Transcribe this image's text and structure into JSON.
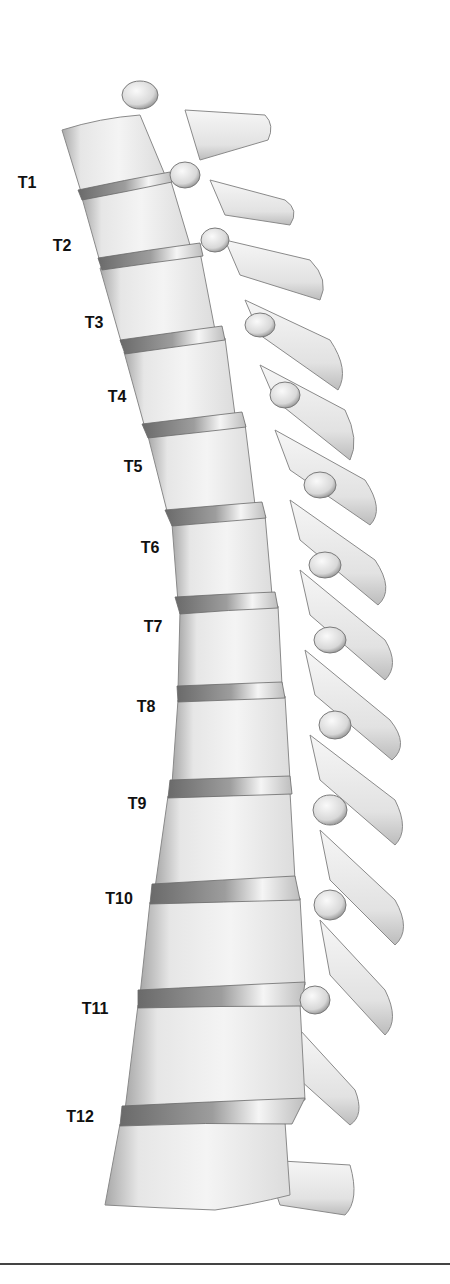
{
  "figure": {
    "labels": [
      {
        "text": "T1",
        "x": 27,
        "y": 183
      },
      {
        "text": "T2",
        "x": 62,
        "y": 246
      },
      {
        "text": "T3",
        "x": 94,
        "y": 323
      },
      {
        "text": "T4",
        "x": 117,
        "y": 397
      },
      {
        "text": "T5",
        "x": 133,
        "y": 467
      },
      {
        "text": "T6",
        "x": 150,
        "y": 548
      },
      {
        "text": "T7",
        "x": 153,
        "y": 627
      },
      {
        "text": "T8",
        "x": 146,
        "y": 707
      },
      {
        "text": "T9",
        "x": 137,
        "y": 804
      },
      {
        "text": "T10",
        "x": 119,
        "y": 899
      },
      {
        "text": "T11",
        "x": 95,
        "y": 1009
      },
      {
        "text": "T12",
        "x": 80,
        "y": 1117
      }
    ],
    "colors": {
      "bone_light": "#f2f2f2",
      "bone_mid": "#d6d6d6",
      "bone_shadow": "#9a9a9a",
      "disc": "#7d7d7d",
      "outline": "#8a8a8a",
      "label": "#111111",
      "rule": "#444444"
    }
  }
}
